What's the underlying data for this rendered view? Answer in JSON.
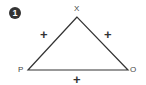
{
  "figure": {
    "number": "1",
    "vertices": {
      "top": "X",
      "left": "P",
      "right": "O"
    },
    "edges": {
      "p_x": "+",
      "x_o": "+",
      "p_o": "+"
    },
    "line_color": "#333333"
  }
}
